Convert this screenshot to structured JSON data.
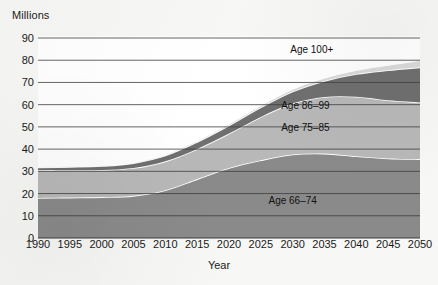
{
  "chart_data": {
    "type": "area",
    "title": "",
    "subtitle": "",
    "xlabel": "Year",
    "ylabel": "Millions",
    "stacked": true,
    "grid": true,
    "legend_position": "inline-labels",
    "xlim": [
      1990,
      2050
    ],
    "ylim": [
      0,
      90
    ],
    "yticks": [
      0,
      10,
      20,
      30,
      40,
      50,
      60,
      70,
      80,
      90
    ],
    "x": [
      1990,
      1995,
      2000,
      2005,
      2010,
      2015,
      2020,
      2025,
      2030,
      2035,
      2040,
      2045,
      2050
    ],
    "xticklabels": [
      "1990",
      "1995",
      "2000",
      "2005",
      "2010",
      "2015",
      "2020",
      "2025",
      "2030",
      "2035",
      "2040",
      "2045",
      "2050"
    ],
    "series": [
      {
        "name": "Age 66-74",
        "label": "Age 66–74",
        "color": "#8a8a8a",
        "values": [
          18.0,
          18.2,
          18.4,
          19.0,
          21.5,
          26.5,
          31.5,
          35.0,
          37.6,
          38.0,
          36.8,
          35.8,
          35.5
        ],
        "label_x": 2030,
        "label_y": 17
      },
      {
        "name": "Age 75-85",
        "label": "Age 75–85",
        "color": "#b8b8b8",
        "values": [
          12.6,
          12.3,
          12.2,
          12.5,
          13.0,
          13.6,
          15.5,
          19.5,
          23.0,
          25.5,
          26.8,
          26.2,
          25.5
        ],
        "label_x": 2032,
        "label_y": 50
      },
      {
        "name": "Age 86-99",
        "label": "Age 86–99",
        "color": "#6f6f6f",
        "values": [
          1.2,
          1.5,
          1.8,
          2.2,
          2.6,
          3.1,
          3.6,
          4.3,
          5.3,
          7.2,
          10.2,
          13.5,
          15.8
        ],
        "label_x": 2032,
        "label_y": 60
      },
      {
        "name": "Age 100+",
        "label": "Age 100+",
        "color": "#d9d9d9",
        "values": [
          0.1,
          0.12,
          0.15,
          0.2,
          0.28,
          0.4,
          0.55,
          0.75,
          0.95,
          1.2,
          1.6,
          2.2,
          3.0
        ],
        "label_x": 2033,
        "label_y": 85
      }
    ],
    "totals": [
      31.9,
      32.1,
      32.6,
      33.9,
      37.4,
      43.6,
      51.2,
      59.6,
      66.9,
      71.9,
      75.4,
      77.7,
      79.8
    ]
  },
  "colors": {
    "background": "#f7f7f5",
    "plot_background": "#ffffff",
    "gridline": "#3d3d3d",
    "text": "#1a1a1a",
    "band_separator": "#ffffff"
  },
  "axis": {
    "y_title": "Millions",
    "x_title": "Year"
  }
}
